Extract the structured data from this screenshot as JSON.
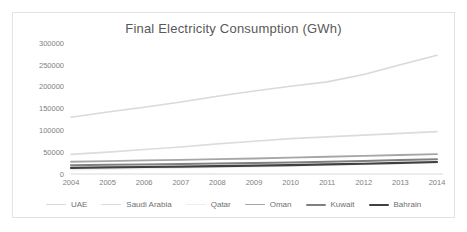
{
  "chart_data": {
    "type": "line",
    "title": "Final Electricity Consumption (GWh)",
    "xlabel": "",
    "ylabel": "",
    "grid": false,
    "legend_position": "bottom",
    "ylim": [
      0,
      300000
    ],
    "ytick_labels": [
      "300000",
      "250000",
      "200000",
      "150000",
      "100000",
      "50000",
      "0"
    ],
    "yticks": [
      300000,
      250000,
      200000,
      150000,
      100000,
      50000,
      0
    ],
    "categories": [
      "2004",
      "2005",
      "2006",
      "2007",
      "2008",
      "2009",
      "2010",
      "2011",
      "2012",
      "2013",
      "2014"
    ],
    "x": [
      2004,
      2005,
      2006,
      2007,
      2008,
      2009,
      2010,
      2011,
      2012,
      2013,
      2014
    ],
    "series": [
      {
        "name": "UAE",
        "color": "#d9d9d9",
        "width": 1.6,
        "values": [
          130000,
          142000,
          153000,
          165000,
          178000,
          190000,
          201000,
          211000,
          228000,
          250000,
          272000
        ]
      },
      {
        "name": "Saudi Arabia",
        "color": "#dcdcdc",
        "width": 1.6,
        "values": [
          45000,
          50000,
          56000,
          62000,
          69000,
          75000,
          81000,
          85000,
          89000,
          93000,
          97000
        ]
      },
      {
        "name": "Qatar",
        "color": "#ededed",
        "width": 1.6,
        "values": [
          10000,
          11000,
          12500,
          14000,
          15500,
          17000,
          18500,
          20000,
          22000,
          24000,
          26000
        ]
      },
      {
        "name": "Oman",
        "color": "#a6a6a6",
        "width": 1.8,
        "values": [
          28000,
          29500,
          31000,
          32500,
          34000,
          35500,
          37500,
          39500,
          41500,
          43500,
          45500
        ]
      },
      {
        "name": "Kuwait",
        "color": "#808080",
        "width": 2.0,
        "values": [
          20000,
          21000,
          22000,
          23000,
          24000,
          25000,
          26500,
          28000,
          30000,
          32000,
          34000
        ]
      },
      {
        "name": "Bahrain",
        "color": "#404040",
        "width": 2.2,
        "values": [
          14000,
          15000,
          16000,
          17000,
          18000,
          19000,
          20500,
          22000,
          23500,
          25500,
          27500
        ]
      }
    ]
  },
  "legend": {
    "items": [
      "UAE",
      "Saudi Arabia",
      "Qatar",
      "Oman",
      "Kuwait",
      "Bahrain"
    ]
  }
}
